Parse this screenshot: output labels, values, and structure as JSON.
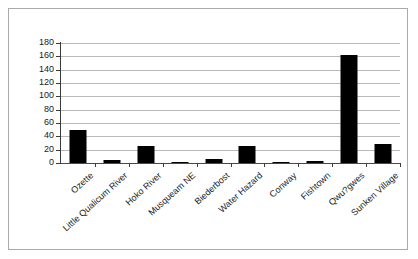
{
  "chart_data": {
    "type": "bar",
    "title": "",
    "subtitle": "",
    "xlabel": "",
    "ylabel": "",
    "categories": [
      "Ozette",
      "Little Qualicum River",
      "Hoko River",
      "Musqueam NE",
      "Biederbost",
      "Water Hazard",
      "Conway",
      "Fishtown",
      "Qwu?gwes",
      "Sunken Village"
    ],
    "values": [
      50,
      5,
      25,
      1,
      6,
      26,
      1,
      3,
      162,
      28
    ],
    "ylim": [
      0,
      180
    ],
    "ytick_step": 20,
    "yticks": [
      0,
      20,
      40,
      60,
      80,
      100,
      120,
      140,
      160,
      180
    ],
    "ytick_labels": [
      "0",
      "20",
      "40",
      "60",
      "80",
      "100",
      "120",
      "140",
      "160",
      "180"
    ],
    "grid": true,
    "legend": false,
    "legend_position": "none",
    "bar_color": "#000000",
    "grid_color": "#b9b9b9",
    "axis_color": "#3a3a3a",
    "plot_background": "#ffffff",
    "border_color": "#aaaaaa"
  }
}
